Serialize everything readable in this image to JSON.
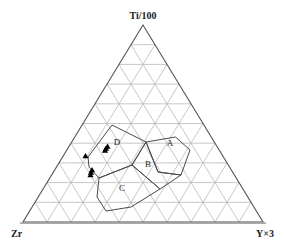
{
  "figure": {
    "type": "ternary-diagram",
    "background_color": "#ffffff"
  },
  "axes": {
    "apex_label": "Ti/100",
    "left_label": "Zr",
    "right_label": "Y×3",
    "outline_color": "#555555",
    "grid_color": "#b9b9b9",
    "grid_divisions": 10
  },
  "fields": {
    "boundary_color": "#4a4a4a",
    "items": [
      {
        "id": "A",
        "label": "A"
      },
      {
        "id": "B",
        "label": "B"
      },
      {
        "id": "C",
        "label": "C"
      },
      {
        "id": "D",
        "label": "D"
      }
    ]
  },
  "chart_data": {
    "type": "scatter",
    "title": "",
    "xlabel": "",
    "ylabel": "",
    "ternary_axes": {
      "top": "Ti/100",
      "left": "Zr",
      "right": "Y×3"
    },
    "grid": true,
    "grid_divisions": 10,
    "legend_position": "none",
    "marker": {
      "shape": "triangle",
      "fill": "#000000",
      "size": 5
    },
    "series": [
      {
        "name": "samples",
        "marker": "filled-triangle",
        "points": [
          {
            "px": 85.5,
            "py": 156.0
          },
          {
            "px": 106.0,
            "py": 148.5
          },
          {
            "px": 107.5,
            "py": 146.5
          },
          {
            "px": 105.0,
            "py": 150.5
          },
          {
            "px": 91.0,
            "py": 172.5
          },
          {
            "px": 92.0,
            "py": 170.0
          },
          {
            "px": 90.5,
            "py": 175.0
          }
        ]
      }
    ],
    "field_polygons": [
      {
        "id": "A",
        "label": "A",
        "label_px": 170.0,
        "label_py": 146.0,
        "vertices_px": [
          [
            146.0,
            142.0
          ],
          [
            175.5,
            137.0
          ],
          [
            190.0,
            150.0
          ],
          [
            181.0,
            175.0
          ],
          [
            158.0,
            172.0
          ]
        ]
      },
      {
        "id": "B",
        "label": "B",
        "label_px": 148.0,
        "label_py": 167.0,
        "vertices_px": [
          [
            146.0,
            142.0
          ],
          [
            158.0,
            172.0
          ],
          [
            181.0,
            175.0
          ],
          [
            160.0,
            189.0
          ],
          [
            132.0,
            165.0
          ]
        ]
      },
      {
        "id": "C",
        "label": "C",
        "label_px": 122.0,
        "label_py": 191.0,
        "vertices_px": [
          [
            132.0,
            165.0
          ],
          [
            160.0,
            189.0
          ],
          [
            131.0,
            207.0
          ],
          [
            106.0,
            211.0
          ],
          [
            97.0,
            197.0
          ],
          [
            99.0,
            178.0
          ]
        ]
      },
      {
        "id": "D",
        "label": "D",
        "label_px": 117.0,
        "label_py": 145.0,
        "vertices_px": [
          [
            112.0,
            125.0
          ],
          [
            146.0,
            142.0
          ],
          [
            132.0,
            165.0
          ],
          [
            99.0,
            178.0
          ],
          [
            89.0,
            167.0
          ],
          [
            88.0,
            157.0
          ]
        ]
      }
    ]
  }
}
